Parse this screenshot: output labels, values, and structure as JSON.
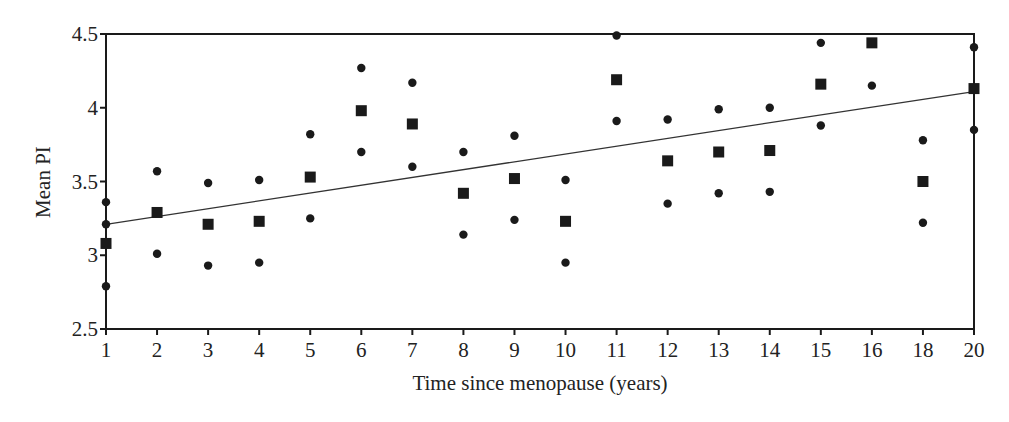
{
  "chart_data": {
    "type": "scatter",
    "title": "",
    "xlabel": "Time since menopause (years)",
    "ylabel": "Mean PI",
    "ylim": [
      2.5,
      4.5
    ],
    "yticks": [
      "2.5",
      "3",
      "3.5",
      "4",
      "4.5"
    ],
    "categories": [
      "1",
      "2",
      "3",
      "4",
      "5",
      "6",
      "7",
      "8",
      "9",
      "10",
      "11",
      "12",
      "13",
      "14",
      "15",
      "16",
      "18",
      "20"
    ],
    "grid": false,
    "legend": null,
    "series": [
      {
        "name": "mean",
        "marker": "square",
        "values": [
          3.08,
          3.29,
          3.21,
          3.23,
          3.53,
          3.98,
          3.89,
          3.42,
          3.52,
          3.23,
          4.19,
          3.64,
          3.7,
          3.71,
          4.16,
          4.44,
          3.5,
          4.13
        ]
      },
      {
        "name": "upper",
        "marker": "circle",
        "values": [
          3.36,
          3.57,
          3.49,
          3.51,
          3.82,
          4.27,
          4.17,
          3.7,
          3.81,
          3.51,
          4.49,
          3.92,
          3.99,
          4.0,
          4.44,
          null,
          3.78,
          4.41
        ]
      },
      {
        "name": "lower",
        "marker": "circle",
        "values": [
          2.79,
          3.01,
          2.93,
          2.95,
          3.25,
          3.7,
          3.6,
          3.14,
          3.24,
          2.95,
          3.91,
          3.35,
          3.42,
          3.43,
          3.88,
          4.15,
          3.22,
          3.85
        ]
      },
      {
        "name": "extra",
        "marker": "circle",
        "x": [
          "1"
        ],
        "values": [
          3.21
        ]
      }
    ],
    "trendline": {
      "type": "linear",
      "start": {
        "x": "1",
        "y": 3.21
      },
      "end": {
        "x": "20",
        "y": 4.11
      }
    }
  }
}
